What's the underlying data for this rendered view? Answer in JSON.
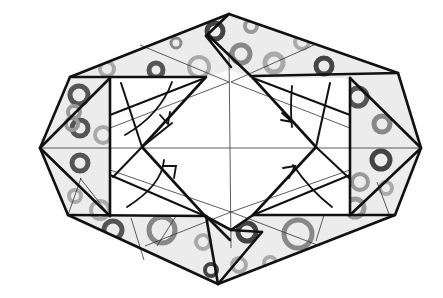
{
  "diagram": {
    "title": "Origami folding diagram: octagonal tessellation unit with four collapse folds",
    "type": "origami-crease-pattern",
    "colors": {
      "background": "#ffffff",
      "paper_fill": "#ececec",
      "line": "#111111",
      "ring_dark": "#555555",
      "ring_light": "#a8a8a8"
    },
    "outer_outline": {
      "shape": "octagon",
      "vertices": [
        [
          229,
          14
        ],
        [
          398,
          73
        ],
        [
          421,
          148
        ],
        [
          395,
          215
        ],
        [
          218,
          284
        ],
        [
          68,
          215
        ],
        [
          40,
          148
        ],
        [
          70,
          77
        ]
      ]
    },
    "inner_squares": [
      {
        "name": "left-square",
        "x": 110,
        "y": 78,
        "w": 95,
        "h": 138
      },
      {
        "name": "right-square",
        "x": 253,
        "y": 78,
        "w": 97,
        "h": 137
      }
    ],
    "center_diamond": {
      "vertices": [
        [
          229,
          70
        ],
        [
          316,
          147
        ],
        [
          231,
          230
        ],
        [
          142,
          147
        ]
      ]
    },
    "fold_arrows": [
      {
        "name": "top-left-fold-arrow",
        "quadrant": "top-left"
      },
      {
        "name": "bottom-left-fold-arrow",
        "quadrant": "bottom-left"
      },
      {
        "name": "top-right-fold-arrow",
        "quadrant": "top-right"
      },
      {
        "name": "bottom-right-fold-arrow",
        "quadrant": "bottom-right"
      }
    ],
    "pattern": "paper printed with scattered gray ring (donut) motifs"
  }
}
